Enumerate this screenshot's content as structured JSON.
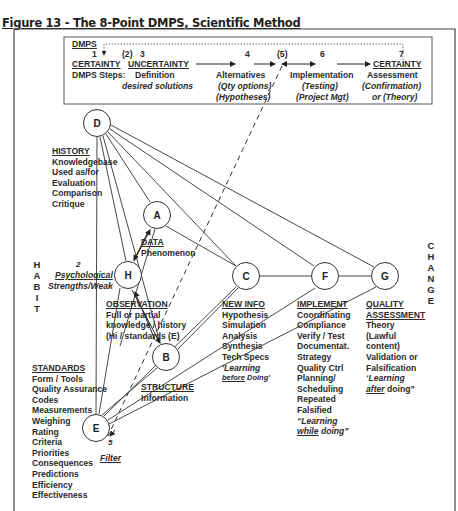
{
  "caption": "Figure 13 - The 8-Point DMPS, Scientific Method",
  "dmps_box": {
    "title": "DMPS",
    "steps_label": "DMPS Steps:",
    "steps": [
      {
        "num": "1",
        "label": "CERTAINTY",
        "lines": []
      },
      {
        "num": "(2)",
        "label": "",
        "lines": []
      },
      {
        "num": "3",
        "label": "UNCERTAINTY",
        "lines": [
          "Definition",
          "desired solutions"
        ]
      },
      {
        "num": "4",
        "label": "",
        "lines": [
          "Alternatives",
          "(Qty options)",
          "(Hypotheses)"
        ]
      },
      {
        "num": "(5)",
        "label": "",
        "lines": []
      },
      {
        "num": "6",
        "label": "",
        "lines": [
          "Implementation",
          "(Testing)",
          "(Project Mgt)"
        ]
      },
      {
        "num": "7",
        "label": "CERTAINTY",
        "lines": [
          "Assessment",
          "(Confirmation)",
          "or (Theory)"
        ]
      }
    ]
  },
  "side_labels": {
    "habit": [
      "H",
      "A",
      "B",
      "I",
      "T"
    ],
    "change": [
      "C",
      "H",
      "A",
      "N",
      "G",
      "E"
    ]
  },
  "nodes": {
    "D": "D",
    "A": "A",
    "H": "H",
    "B": "B",
    "E": "E",
    "C": "C",
    "F": "F",
    "G": "G"
  },
  "history": {
    "title": "HISTORY",
    "lines": [
      "Knowledgebase",
      "Used as/for",
      "Evaluation",
      "Comparison",
      "Critique"
    ]
  },
  "data": {
    "title": "DATA",
    "lines": [
      "Phenomenon"
    ]
  },
  "psych": {
    "num": "2",
    "lines": [
      "Psychological",
      "Strengths/Weak"
    ]
  },
  "observation": {
    "title": "OBSERVATION",
    "lines": [
      "Full or partial",
      "knowledge / history",
      "(Hi / standards (E)"
    ]
  },
  "structure": {
    "title": "STRUCTURE",
    "lines": [
      "Information"
    ]
  },
  "standards": {
    "title": "STANDARDS",
    "lines": [
      "Form / Tools",
      "Quality Assurance",
      "Codes",
      "Measurements",
      "Weighing",
      "Rating",
      "Criteria",
      "Priorities",
      "Consequences",
      "Predictions",
      "Efficiency",
      "Effectiveness"
    ]
  },
  "filter": {
    "num": "5",
    "label": "Filter"
  },
  "new_info": {
    "title": "NEW INFO",
    "lines": [
      "Hypothesis",
      "Simulation",
      "Analysis",
      "Synthesis",
      "Tech Specs"
    ],
    "quote_a": "'Learning",
    "quote_b_u": "before",
    "quote_b": " Doing'"
  },
  "implement": {
    "title": "IMPLEMENT",
    "lines": [
      "Coordinating",
      "Compliance",
      "Verify / Test",
      "Documentat.",
      "Strategy",
      "Quality Ctrl",
      "Planning/",
      "Scheduling",
      "Repeated",
      "Falsified"
    ],
    "quote_a": "“Learning",
    "quote_b_u": "while",
    "quote_b": " doing”"
  },
  "quality": {
    "title1": "QUALITY",
    "title2": "ASSESSMENT",
    "lines": [
      "Theory",
      "(Lawful",
      "content)",
      "Validation or",
      "Falsification"
    ],
    "quote_a": "‘Learning",
    "quote_b_u": "after",
    "quote_b": " doing”"
  }
}
